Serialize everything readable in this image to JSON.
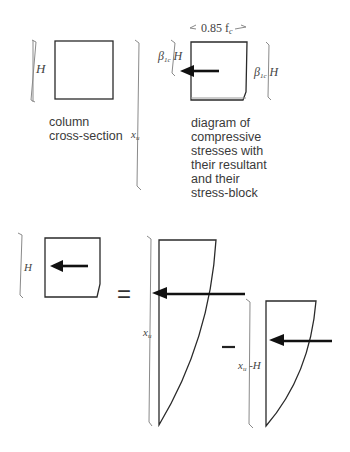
{
  "labels": {
    "H_left_top": "H",
    "fc_label": "0.85 f",
    "fc_sub": "c",
    "beta_left": "β",
    "beta_left_sub": "1c",
    "beta_left_H": " H",
    "beta_right": "β",
    "beta_right_sub": "1c",
    "beta_right_H": " H",
    "xu_top": "x",
    "xu_top_sub": "u",
    "H_bottom": "H",
    "xu_bottom": "x",
    "xu_bottom_sub": "u",
    "xuH_x": "x",
    "xuH_sub": "u",
    "xuH_rest": " -H",
    "equals": "=",
    "minus": "–"
  },
  "captions": {
    "column": [
      "column",
      "cross-section"
    ],
    "diagram": [
      "diagram of",
      "compressive",
      "stresses with",
      "their resultant",
      "and their",
      "stress-block"
    ]
  },
  "colors": {
    "line": "#2a2a2a",
    "dimension": "#8a8a8a",
    "arrow": "#111111",
    "text": "#3a3a3a"
  }
}
